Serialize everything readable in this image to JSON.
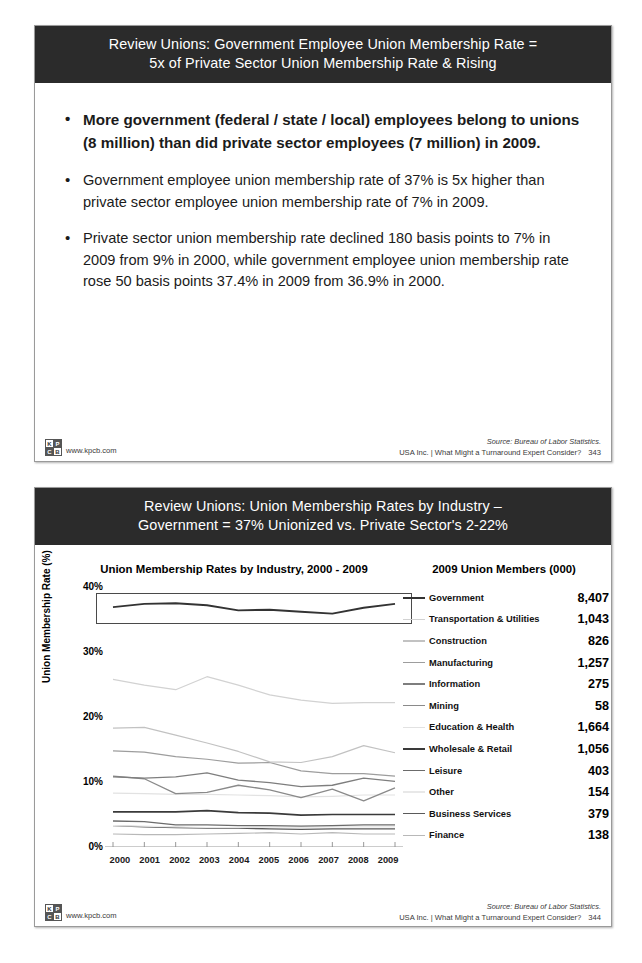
{
  "slide1": {
    "title_line1": "Review Unions: Government Employee Union Membership Rate =",
    "title_line2": "5x of Private Sector Union Membership Rate & Rising",
    "bullets": [
      "More government (federal / state / local) employees belong to unions (8 million) than did private sector employees (7 million) in 2009.",
      "Government employee union membership rate of 37% is 5x higher than private sector employee union membership rate of 7% in 2009.",
      "Private sector union membership rate declined 180 basis points to 7% in 2009 from 9% in 2000, while government employee union membership rate rose 50 basis points 37.4% in 2009 from 36.9% in 2000."
    ],
    "footer": {
      "logo_letters": [
        "K",
        "P",
        "C",
        "B"
      ],
      "url": "www.kpcb.com",
      "source": "Source: Bureau of Labor Statistics.",
      "deck": "USA Inc. | What Might a Turnaround Expert Consider?",
      "page": "343"
    }
  },
  "slide2": {
    "title_line1": "Review Unions: Union Membership Rates by Industry –",
    "title_line2": "Government = 37% Unionized vs. Private Sector's 2-22%",
    "left_title": "Union Membership Rates by Industry, 2000 - 2009",
    "right_title": "2009 Union Members (000)",
    "footer": {
      "logo_letters": [
        "K",
        "P",
        "C",
        "B"
      ],
      "url": "www.kpcb.com",
      "source": "Source: Bureau of Labor Statistics.",
      "deck": "USA Inc. | What Might a Turnaround Expert Consider?",
      "page": "344"
    }
  },
  "chart_data": {
    "type": "line",
    "title": "Union Membership Rates by Industry, 2000 - 2009",
    "xlabel": "",
    "ylabel": "Union Membership Rate (%)",
    "x": [
      "2000",
      "2001",
      "2002",
      "2003",
      "2004",
      "2005",
      "2006",
      "2007",
      "2008",
      "2009"
    ],
    "ylim": [
      0,
      40
    ],
    "yticks": [
      "0%",
      "10%",
      "20%",
      "30%",
      "40%"
    ],
    "grid": false,
    "legend_position": "right",
    "highlight_series": "Government",
    "members_header": "2009 Union Members (000)",
    "series": [
      {
        "name": "Government",
        "members_2009": "8,407",
        "color": "#333333",
        "width": 1.9,
        "values": [
          36.9,
          37.4,
          37.5,
          37.2,
          36.4,
          36.5,
          36.2,
          35.9,
          36.8,
          37.4
        ]
      },
      {
        "name": "Transportation & Utilities",
        "members_2009": "1,043",
        "color": "#d2d2d2",
        "width": 1.2,
        "values": [
          25.8,
          24.9,
          24.2,
          26.2,
          24.9,
          23.4,
          22.6,
          22.1,
          22.2,
          22.2
        ]
      },
      {
        "name": "Construction",
        "members_2009": "826",
        "color": "#c2c2c2",
        "width": 1.2,
        "values": [
          18.3,
          18.4,
          17.2,
          16.0,
          14.7,
          13.1,
          13.0,
          13.9,
          15.6,
          14.5
        ]
      },
      {
        "name": "Manufacturing",
        "members_2009": "1,257",
        "color": "#9d9d9d",
        "width": 1.2,
        "values": [
          14.8,
          14.6,
          13.9,
          13.5,
          12.9,
          13.0,
          11.7,
          11.3,
          11.3,
          10.9
        ]
      },
      {
        "name": "Information",
        "members_2009": "275",
        "color": "#7e7e7e",
        "width": 1.3,
        "values": [
          10.8,
          10.6,
          10.8,
          11.4,
          10.3,
          9.9,
          9.3,
          9.5,
          10.6,
          10.1
        ]
      },
      {
        "name": "Mining",
        "members_2009": "58",
        "color": "#8a8a8a",
        "width": 1.3,
        "values": [
          10.9,
          10.5,
          8.2,
          8.4,
          9.5,
          8.8,
          7.6,
          8.9,
          7.1,
          9.1
        ]
      },
      {
        "name": "Education & Health",
        "members_2009": "1,664",
        "color": "#e2e2e2",
        "width": 1.2,
        "values": [
          8.3,
          8.2,
          8.1,
          8.1,
          8.0,
          7.9,
          7.7,
          7.8,
          8.0,
          8.0
        ]
      },
      {
        "name": "Wholesale & Retail",
        "members_2009": "1,056",
        "color": "#3a3a3a",
        "width": 1.7,
        "values": [
          5.4,
          5.4,
          5.4,
          5.6,
          5.3,
          5.2,
          4.9,
          5.0,
          5.0,
          5.0
        ]
      },
      {
        "name": "Leisure",
        "members_2009": "403",
        "color": "#6b6b6b",
        "width": 1.3,
        "values": [
          4.0,
          3.9,
          3.4,
          3.4,
          3.3,
          3.3,
          3.2,
          3.3,
          3.4,
          3.4
        ]
      },
      {
        "name": "Other",
        "members_2009": "154",
        "color": "#e8e8e8",
        "width": 1.2,
        "values": [
          3.3,
          3.2,
          3.1,
          3.0,
          3.0,
          3.1,
          3.0,
          3.1,
          3.1,
          3.1
        ]
      },
      {
        "name": "Business Services",
        "members_2009": "379",
        "color": "#5a5a5a",
        "width": 1.3,
        "values": [
          3.3,
          3.1,
          3.0,
          2.9,
          2.9,
          2.8,
          2.7,
          2.8,
          2.8,
          2.8
        ]
      },
      {
        "name": "Finance",
        "members_2009": "138",
        "color": "#b8b8b8",
        "width": 1.2,
        "values": [
          2.0,
          1.9,
          1.9,
          2.0,
          2.1,
          2.2,
          2.0,
          2.2,
          2.0,
          2.0
        ]
      }
    ]
  }
}
